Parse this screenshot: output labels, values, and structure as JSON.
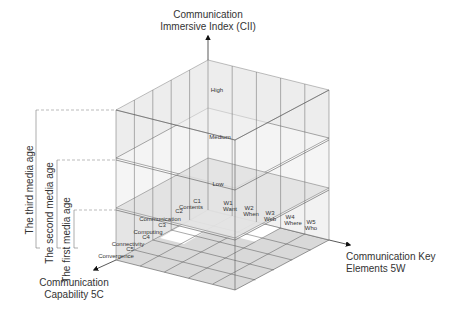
{
  "diagram": {
    "axes": {
      "vertical": {
        "title_line1": "Communication",
        "title_line2": "Immersive Index (CII)"
      },
      "right": {
        "title_line1": "Communication Key",
        "title_line2": "Elements 5W"
      },
      "left": {
        "title_line1": "Communication",
        "title_line2": "Capability 5C"
      }
    },
    "levels": [
      {
        "label": "High"
      },
      {
        "label": "Medium"
      },
      {
        "label": "Low"
      }
    ],
    "w_elements": [
      {
        "code": "W1",
        "name": "Want"
      },
      {
        "code": "W2",
        "name": "When"
      },
      {
        "code": "W3",
        "name": "Web"
      },
      {
        "code": "W4",
        "name": "Where"
      },
      {
        "code": "W5",
        "name": "Who"
      }
    ],
    "c_elements": [
      {
        "code": "C1",
        "name": "Contents"
      },
      {
        "code": "C2",
        "name": "Communication"
      },
      {
        "code": "C3",
        "name": "Computing"
      },
      {
        "code": "C4",
        "name": "Connectivity"
      },
      {
        "code": "C5",
        "name": "Convergence"
      }
    ],
    "ages": [
      {
        "label": "The third media age"
      },
      {
        "label": "The second media age"
      },
      {
        "label": "The first media age"
      }
    ],
    "colors": {
      "face_gray": "#d9d9d9",
      "face_light": "#ececec",
      "line": "#555555",
      "inner_white": "#ffffff"
    }
  }
}
